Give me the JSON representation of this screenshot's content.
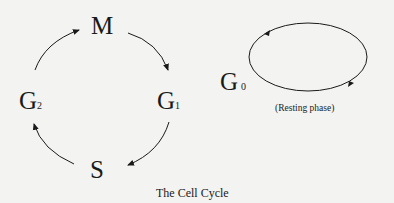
{
  "diagram": {
    "title": "The Cell Cycle",
    "phases": [
      {
        "id": "M",
        "label": "M",
        "subscript": ""
      },
      {
        "id": "G1",
        "label": "G",
        "subscript": "1"
      },
      {
        "id": "S",
        "label": "S",
        "subscript": ""
      },
      {
        "id": "G2",
        "label": "G",
        "subscript": "2"
      }
    ],
    "cycle_order": [
      "M",
      "G1",
      "S",
      "G2",
      "M"
    ],
    "resting": {
      "label": "G",
      "subscript": "0",
      "caption": "(Resting phase)"
    },
    "colors": {
      "background": "#f3f3f1",
      "ink": "#1a1a1a"
    }
  }
}
